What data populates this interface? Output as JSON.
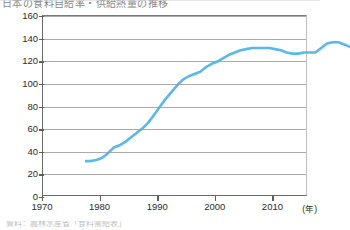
{
  "caption": {
    "text": "日本の食料自給率・供給熱量の推移",
    "visible_note": "（上端が見切れた見出し行）"
  },
  "source_note": {
    "text": "資料：農林水産省「食料需給表」"
  },
  "axes": {
    "y_ticks": [
      "0",
      "20",
      "40",
      "60",
      "80",
      "100",
      "120",
      "140",
      "160"
    ],
    "x_ticks": [
      "1970",
      "1980",
      "1990",
      "2000",
      "2010"
    ],
    "x_unit": "(年)"
  },
  "chart_data": {
    "type": "line",
    "title": "日本の食料自給率・供給熱量の推移",
    "xlabel": "(年)",
    "ylabel": "",
    "xlim": [
      1970,
      2016
    ],
    "ylim": [
      0,
      160
    ],
    "ytick_interval": 20,
    "grid": true,
    "legend": "none",
    "line_color": "#5bb8e8",
    "line_width": 2.6,
    "series": [
      {
        "name": "指数",
        "x": [
          1970,
          1971,
          1972,
          1973,
          1974,
          1975,
          1976,
          1977,
          1978,
          1979,
          1980,
          1981,
          1982,
          1983,
          1984,
          1985,
          1986,
          1987,
          1988,
          1989,
          1990,
          1991,
          1992,
          1993,
          1994,
          1995,
          1996,
          1997,
          1998,
          1999,
          2000,
          2001,
          2002,
          2003,
          2004,
          2005,
          2006,
          2007,
          2008,
          2009,
          2010,
          2011,
          2012,
          2013,
          2014,
          2015,
          2016
        ],
        "values": [
          45,
          45,
          46,
          48,
          52,
          57,
          59,
          62,
          66,
          70,
          74,
          79,
          86,
          93,
          100,
          106,
          112,
          117,
          120,
          122,
          124,
          128,
          131,
          133,
          136,
          139,
          141,
          143,
          144,
          145,
          145,
          145,
          145,
          144,
          143,
          141,
          140,
          140,
          141,
          141,
          141,
          145,
          149,
          150,
          150,
          148,
          146
        ]
      }
    ]
  }
}
